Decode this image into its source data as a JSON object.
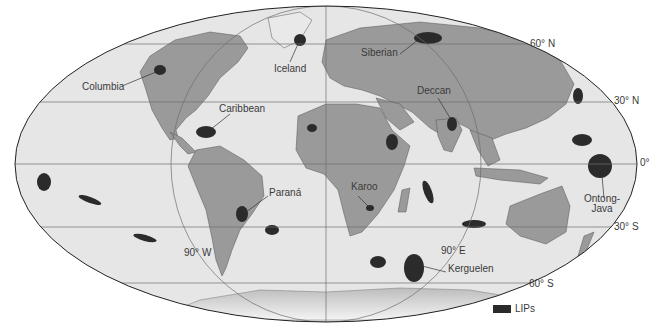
{
  "map": {
    "projection": "Mollweide",
    "colors": {
      "ocean": "#e6e6e6",
      "land": "#9a9a9a",
      "lip": "#2b2b2b",
      "grid": "#6e6e6e",
      "outline": "#222222",
      "background": "#ffffff"
    },
    "parallels": [
      {
        "label": "60° N",
        "y": 44
      },
      {
        "label": "30° N",
        "y": 102
      },
      {
        "label": "0°",
        "y": 164
      },
      {
        "label": "30° S",
        "y": 227
      },
      {
        "label": "60° S",
        "y": 283
      }
    ],
    "meridians": [
      {
        "label": "90° W"
      },
      {
        "label": "90° E"
      }
    ],
    "lip_labels": [
      {
        "name": "Columbia"
      },
      {
        "name": "Iceland"
      },
      {
        "name": "Siberian"
      },
      {
        "name": "Caribbean"
      },
      {
        "name": "Deccan"
      },
      {
        "name": "Paraná"
      },
      {
        "name": "Karoo"
      },
      {
        "name": "Ontong-Java",
        "line1": "Ontong-",
        "line2": "Java"
      },
      {
        "name": "Kerguelen"
      }
    ],
    "legend": {
      "label": "LIPs"
    }
  }
}
